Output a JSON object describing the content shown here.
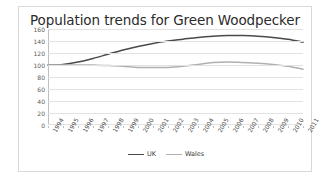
{
  "chart_data": {
    "type": "line",
    "title": "Population trends for Green Woodpecker",
    "xlabel": "",
    "ylabel": "",
    "ylim": [
      0,
      160
    ],
    "ytick_step": 20,
    "yticks": [
      160,
      140,
      120,
      100,
      80,
      60,
      40,
      20,
      0
    ],
    "grid": true,
    "legend_position": "bottom",
    "categories": [
      "1994",
      "1995",
      "1996",
      "1997",
      "1998",
      "1999",
      "2000",
      "2001",
      "2002",
      "2003",
      "2004",
      "2005",
      "2006",
      "2007",
      "2008",
      "2009",
      "2010",
      "2011"
    ],
    "series": [
      {
        "name": "UK",
        "color": "#4a4a4a",
        "values": [
          100,
          101,
          105,
          111,
          118,
          125,
          131,
          136,
          140,
          143,
          146,
          148,
          149,
          149,
          148,
          146,
          143,
          138
        ]
      },
      {
        "name": "Wales",
        "color": "#b0b0b0",
        "values": [
          100,
          100,
          100,
          100,
          99,
          98,
          96,
          96,
          96,
          98,
          101,
          104,
          105,
          104,
          103,
          101,
          98,
          93
        ]
      }
    ]
  },
  "legend": {
    "items": [
      {
        "label": "UK",
        "color": "#4a4a4a"
      },
      {
        "label": "Wales",
        "color": "#b0b0b0"
      }
    ]
  },
  "colors": {
    "uk_line": "#4a4a4a",
    "wales_line": "#b0b0b0",
    "gridline": "#e2e2e2",
    "axis": "#bfbfbf",
    "card_border": "#d9d9d9",
    "background": "#ffffff",
    "title_text": "#2b2b2b",
    "tick_text": "#5a5a5a"
  }
}
